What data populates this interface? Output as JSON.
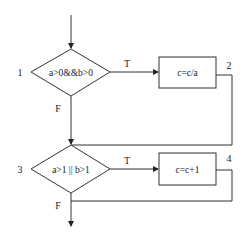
{
  "diagram": {
    "type": "flowchart",
    "colors": {
      "stroke": "#333333",
      "text": "#222222",
      "background": "#ffffff"
    },
    "nodes": [
      {
        "id": "1",
        "kind": "decision",
        "number": "1",
        "text": "a>0&&b>0"
      },
      {
        "id": "2",
        "kind": "process",
        "number": "2",
        "text": "c=c/a"
      },
      {
        "id": "3",
        "kind": "decision",
        "number": "3",
        "text": "a>1 || b>1"
      },
      {
        "id": "4",
        "kind": "process",
        "number": "4",
        "text": "c=c+1"
      }
    ],
    "edges": [
      {
        "from": "start",
        "to": "1",
        "label": ""
      },
      {
        "from": "1",
        "to": "2",
        "label": "T"
      },
      {
        "from": "1",
        "to": "3",
        "label": "F"
      },
      {
        "from": "2",
        "to": "3",
        "label": ""
      },
      {
        "from": "3",
        "to": "4",
        "label": "T"
      },
      {
        "from": "3",
        "to": "end",
        "label": "F"
      },
      {
        "from": "4",
        "to": "end",
        "label": ""
      }
    ]
  }
}
